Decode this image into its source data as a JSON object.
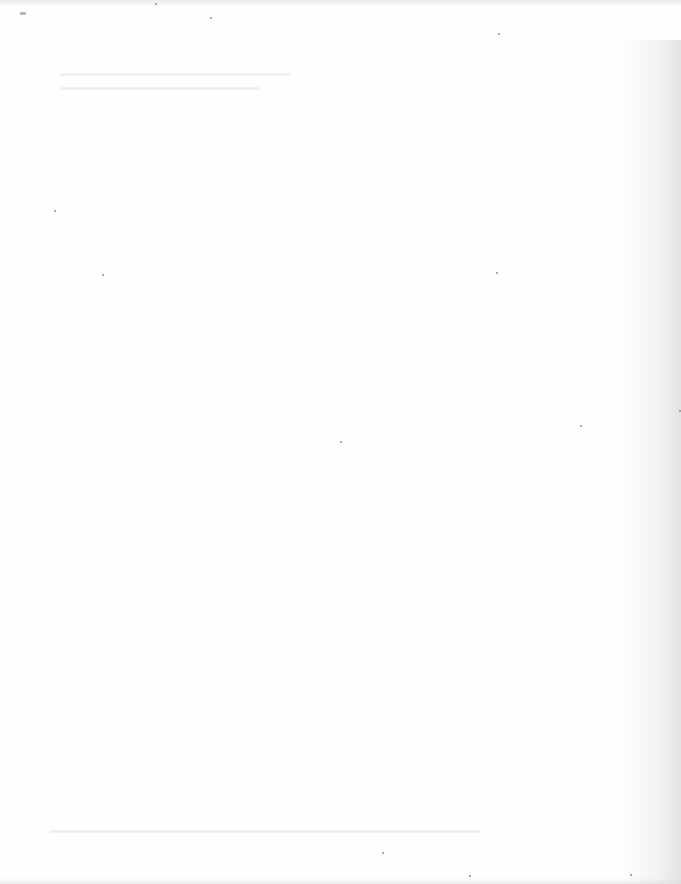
{
  "document": {
    "type": "scanned-page",
    "content": "",
    "state": "blank"
  },
  "colors": {
    "paper": "#fefefe",
    "speck": "#8a8a8a",
    "edge_shadow": "#c8c8c8"
  }
}
